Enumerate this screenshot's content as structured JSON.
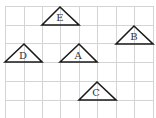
{
  "diagram": {
    "grid": {
      "x_lines": [
        5,
        24,
        42,
        60,
        79,
        97,
        116,
        134,
        153
      ],
      "y_lines": [
        6,
        25,
        43,
        62,
        81,
        100,
        118
      ],
      "color": "#d4d4d4"
    },
    "triangles": [
      {
        "label": "E",
        "points": "42,25 60,7 79,25",
        "lx": 60,
        "ly": 21
      },
      {
        "label": "B",
        "points": "116,44 134,26 153,44",
        "lx": 134,
        "ly": 40
      },
      {
        "label": "D",
        "points": "5,62 24,44 42,62",
        "lx": 23,
        "ly": 59
      },
      {
        "label": "A",
        "points": "60,62 79,44 97,62",
        "lx": 78,
        "ly": 59
      },
      {
        "label": "C",
        "points": "79,100 97,82 116,100",
        "lx": 96,
        "ly": 96
      }
    ]
  }
}
